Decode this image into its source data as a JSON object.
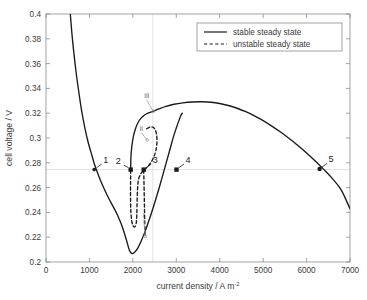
{
  "chart_data": {
    "type": "line",
    "title": "",
    "xlabel": "current density / A m-2",
    "xlabel_base": "current density / A m",
    "xlabel_sup": "-2",
    "ylabel": "cell voltage / V",
    "xlim": [
      0,
      7000
    ],
    "ylim": [
      0.2,
      0.4
    ],
    "xticks": [
      0,
      1000,
      2000,
      3000,
      4000,
      5000,
      6000,
      7000
    ],
    "yticks": [
      0.2,
      0.22,
      0.24,
      0.26,
      0.28,
      0.3,
      0.32,
      0.34,
      0.36,
      0.38,
      0.4
    ],
    "xtick_labels": [
      "0",
      "1000",
      "2000",
      "3000",
      "4000",
      "5000",
      "6000",
      "7000"
    ],
    "ytick_labels": [
      "0.2",
      "0.22",
      "0.24",
      "0.26",
      "0.28",
      "0.3",
      "0.32",
      "0.34",
      "0.36",
      "0.38",
      "0.4"
    ],
    "grid": false,
    "legend_position": "top-right",
    "series": [
      {
        "name": "stable steady state",
        "style": "solid",
        "color": "#1a1a1a",
        "points": [
          [
            560,
            0.4
          ],
          [
            600,
            0.383
          ],
          [
            650,
            0.366
          ],
          [
            700,
            0.351
          ],
          [
            760,
            0.336
          ],
          [
            820,
            0.322
          ],
          [
            890,
            0.309
          ],
          [
            960,
            0.298
          ],
          [
            1040,
            0.288
          ],
          [
            1110,
            0.2795
          ],
          [
            1190,
            0.2715
          ],
          [
            1270,
            0.2645
          ],
          [
            1360,
            0.2575
          ],
          [
            1450,
            0.251
          ],
          [
            1550,
            0.2445
          ],
          [
            1650,
            0.2375
          ],
          [
            1750,
            0.229
          ],
          [
            1850,
            0.218
          ],
          [
            1920,
            0.2095
          ],
          [
            1970,
            0.207
          ],
          [
            2030,
            0.2075
          ],
          [
            2110,
            0.211
          ],
          [
            2200,
            0.2175
          ],
          [
            2290,
            0.2255
          ],
          [
            2380,
            0.2345
          ],
          [
            2460,
            0.243
          ],
          [
            2540,
            0.252
          ],
          [
            2620,
            0.2615
          ],
          [
            2700,
            0.2715
          ],
          [
            2780,
            0.2815
          ],
          [
            2860,
            0.2915
          ],
          [
            2930,
            0.3005
          ],
          [
            3000,
            0.308
          ],
          [
            3060,
            0.314
          ],
          [
            3110,
            0.3185
          ],
          [
            3140,
            0.32
          ]
        ]
      },
      {
        "name": "stable steady state upper branch",
        "style": "solid",
        "color": "#1a1a1a",
        "points": [
          [
            1950,
            0.2745
          ],
          [
            1955,
            0.284
          ],
          [
            1975,
            0.293
          ],
          [
            2010,
            0.301
          ],
          [
            2060,
            0.3075
          ],
          [
            2120,
            0.3125
          ],
          [
            2190,
            0.316
          ],
          [
            2270,
            0.3185
          ],
          [
            2360,
            0.3202
          ],
          [
            2460,
            0.3215
          ],
          [
            2600,
            0.3235
          ],
          [
            2760,
            0.3255
          ],
          [
            2950,
            0.3272
          ],
          [
            3150,
            0.3283
          ],
          [
            3370,
            0.329
          ],
          [
            3600,
            0.3292
          ],
          [
            3800,
            0.3288
          ],
          [
            4000,
            0.3278
          ],
          [
            4200,
            0.3262
          ],
          [
            4400,
            0.324
          ],
          [
            4600,
            0.3212
          ],
          [
            4800,
            0.3178
          ],
          [
            5000,
            0.314
          ],
          [
            5200,
            0.3096
          ],
          [
            5400,
            0.3048
          ],
          [
            5600,
            0.2996
          ],
          [
            5800,
            0.294
          ],
          [
            6000,
            0.288
          ],
          [
            6200,
            0.2815
          ],
          [
            6400,
            0.2745
          ],
          [
            6600,
            0.267
          ],
          [
            6800,
            0.258
          ],
          [
            7000,
            0.243
          ]
        ]
      },
      {
        "name": "unstable steady state",
        "style": "dashed",
        "color": "#1a1a1a",
        "points": [
          [
            2320,
            0.3075
          ],
          [
            2420,
            0.309
          ],
          [
            2500,
            0.3075
          ],
          [
            2545,
            0.303
          ],
          [
            2555,
            0.2965
          ],
          [
            2530,
            0.29
          ],
          [
            2480,
            0.2845
          ],
          [
            2410,
            0.28
          ],
          [
            2330,
            0.2765
          ],
          [
            2250,
            0.274
          ],
          [
            2180,
            0.271
          ],
          [
            2130,
            0.2665
          ],
          [
            2110,
            0.26
          ],
          [
            2100,
            0.252
          ],
          [
            2095,
            0.244
          ],
          [
            2090,
            0.237
          ],
          [
            2080,
            0.232
          ],
          [
            2050,
            0.2285
          ],
          [
            2010,
            0.229
          ],
          [
            1975,
            0.233
          ],
          [
            1955,
            0.24
          ],
          [
            1948,
            0.249
          ],
          [
            1946,
            0.258
          ],
          [
            1948,
            0.266
          ],
          [
            1950,
            0.2745
          ]
        ]
      },
      {
        "name": "unstable inner dashed",
        "style": "dashed",
        "color": "#1a1a1a",
        "points": [
          [
            2250,
            0.274
          ],
          [
            2255,
            0.266
          ],
          [
            2260,
            0.257
          ],
          [
            2265,
            0.248
          ],
          [
            2270,
            0.239
          ],
          [
            2275,
            0.231
          ],
          [
            2280,
            0.225
          ],
          [
            2288,
            0.2205
          ]
        ]
      }
    ],
    "markers": [
      {
        "label": "1",
        "x": 1110,
        "y": 0.2745,
        "shape": "arrow",
        "label_dx": 9,
        "label_dy": -7
      },
      {
        "label": "2",
        "x": 1950,
        "y": 0.2745,
        "shape": "square",
        "label_dx": -10,
        "label_dy": -6
      },
      {
        "label": "3",
        "x": 2250,
        "y": 0.2745,
        "shape": "square",
        "label_dx": 9,
        "label_dy": -7
      },
      {
        "label": "4",
        "x": 3005,
        "y": 0.2745,
        "shape": "square",
        "label_dx": 9,
        "label_dy": -7
      },
      {
        "label": "5",
        "x": 6300,
        "y": 0.275,
        "shape": "dot",
        "label_dx": 9,
        "label_dy": -7
      }
    ],
    "annotations": [
      {
        "label": "i",
        "x": 2288,
        "y": 0.2205,
        "text_x": 2250,
        "text_y": 0.2355
      },
      {
        "label": "ii",
        "x": 2330,
        "y": 0.2985,
        "text_x": 2195,
        "text_y": 0.3055
      },
      {
        "label": "iii",
        "x": 2470,
        "y": 0.3215,
        "text_x": 2320,
        "text_y": 0.332
      }
    ],
    "hline": {
      "y": 0.2745,
      "color": "#d6d6d6"
    },
    "vline": {
      "x": 2460,
      "color": "#d6d6d6"
    }
  },
  "legend": {
    "entries": [
      {
        "label": "stable steady state",
        "style": "solid"
      },
      {
        "label": "unstable steady state",
        "style": "dashed"
      }
    ]
  }
}
